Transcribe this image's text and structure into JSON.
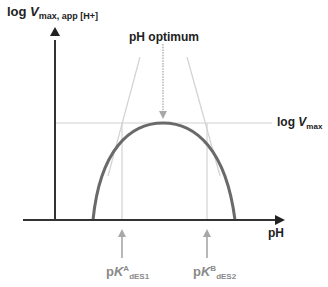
{
  "diagram": {
    "type": "pH-rate profile",
    "y_axis_label": {
      "prefix": "log ",
      "var": "V",
      "subscript": "max, app [H+]"
    },
    "x_axis_label": "pH",
    "optimum_label": "pH optimum",
    "vmax_label": {
      "prefix": "log ",
      "var": "V",
      "subscript": "max"
    },
    "pka_left": {
      "prefix": "p",
      "var": "K",
      "superscript": "A",
      "subscript": "dES1"
    },
    "pka_right": {
      "prefix": "p",
      "var": "K",
      "superscript": "B",
      "subscript": "dES2"
    },
    "colors": {
      "axis": "#333333",
      "curve": "#6a6a6a",
      "guide_lines": "#cfcfcf",
      "arrows": "#a0a0a0",
      "label_dark": "#222222",
      "label_gray": "#8a8a8a"
    }
  }
}
